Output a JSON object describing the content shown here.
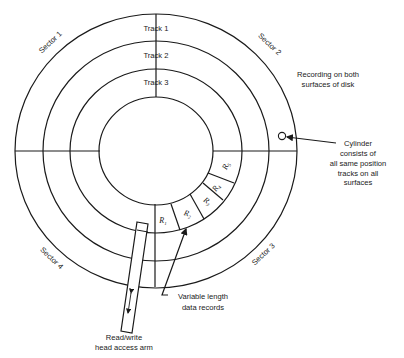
{
  "diagram": {
    "type": "disk-storage-layout",
    "tracks": [
      {
        "label": "Track 1"
      },
      {
        "label": "Track 2"
      },
      {
        "label": "Track 3"
      }
    ],
    "sectors": [
      {
        "label": "Sector 1"
      },
      {
        "label": "Sector 2"
      },
      {
        "label": "Sector 3"
      },
      {
        "label": "Sector 4"
      }
    ],
    "records": [
      {
        "letter": "R",
        "sub": "1"
      },
      {
        "letter": "R",
        "sub": "2"
      },
      {
        "letter": "R",
        "sub": "3"
      },
      {
        "letter": "R",
        "sub": "4"
      },
      {
        "letter": "R",
        "sub": "5"
      }
    ],
    "annotations": {
      "recording": [
        "Recording on both",
        "surfaces of disk"
      ],
      "cylinder": [
        "Cylinder",
        "consists of",
        "all same position",
        "tracks on all",
        "surfaces"
      ],
      "records": [
        "Variable length",
        "data records"
      ],
      "arm": [
        "Read/write",
        "head access arm"
      ]
    },
    "colors": {
      "line": "#1a1a1a",
      "background": "#ffffff"
    }
  }
}
